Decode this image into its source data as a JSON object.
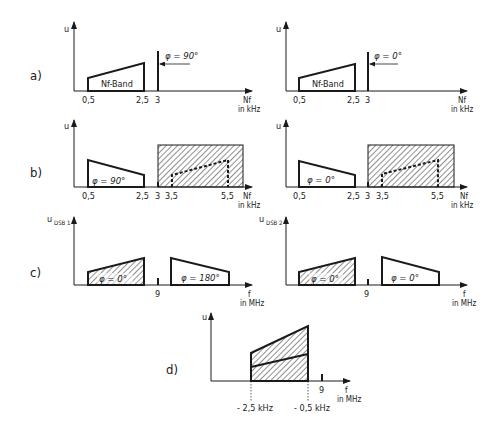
{
  "figure": {
    "panels": {
      "a": {
        "label": "a)",
        "left": {
          "y_axis": "u",
          "x_axis": "Nf",
          "x_unit": "in kHz",
          "band_label": "Nf-Band",
          "ticks": [
            "0,5",
            "2,5",
            "3"
          ],
          "carrier_phase": "φ = 90°"
        },
        "right": {
          "y_axis": "u",
          "x_axis": "Nf",
          "x_unit": "in kHz",
          "band_label": "Nf-Band",
          "ticks": [
            "0,5",
            "2,5",
            "3"
          ],
          "carrier_phase": "φ = 0°"
        }
      },
      "b": {
        "label": "b)",
        "left": {
          "y_axis": "u",
          "x_axis": "Nf",
          "x_unit": "in kHz",
          "band_phase": "φ = 90°",
          "ticks": [
            "0,5",
            "2,5",
            "3",
            "3,5",
            "5,5"
          ]
        },
        "right": {
          "y_axis": "u",
          "x_axis": "Nf",
          "x_unit": "in kHz",
          "band_phase": "φ = 0°",
          "ticks": [
            "0,5",
            "2,5",
            "3",
            "3,5",
            "5,5"
          ]
        }
      },
      "c": {
        "label": "c)",
        "left": {
          "y_axis": "u",
          "y_sub": "DSB 1",
          "x_axis": "f",
          "x_unit": "in MHz",
          "lsb_phase": "φ = 0°",
          "usb_phase": "φ = 180°",
          "ticks": [
            "9"
          ]
        },
        "right": {
          "y_axis": "u",
          "y_sub": "DSB 2",
          "x_axis": "f",
          "x_unit": "in MHz",
          "lsb_phase": "φ = 0°",
          "usb_phase": "φ = 0°",
          "ticks": [
            "9"
          ]
        }
      },
      "d": {
        "label": "d)",
        "y_axis": "u",
        "x_axis": "f",
        "x_unit": "in MHz",
        "ticks": [
          "9"
        ],
        "markers": [
          "- 2,5 kHz",
          "- 0,5 kHz"
        ]
      }
    }
  }
}
